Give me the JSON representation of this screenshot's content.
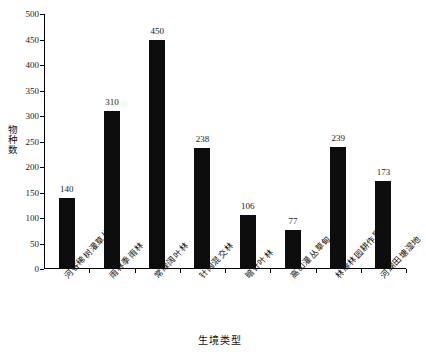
{
  "chart_data": {
    "type": "bar",
    "title": "",
    "xlabel": "生境类型",
    "ylabel": "物种数",
    "categories": [
      "河谷稀树灌草丛",
      "雨林季雨林",
      "常绿阔叶林",
      "针阔混交林",
      "暗针叶林",
      "高山灌丛草甸",
      "林缘林园耕作旱地",
      "河湖田塘湿地"
    ],
    "values": [
      140,
      310,
      450,
      238,
      106,
      77,
      239,
      173
    ],
    "value_labels": [
      "140",
      "310",
      "450",
      "238",
      "106",
      "77",
      "239",
      "173"
    ],
    "ylim": [
      0,
      500
    ],
    "ytick_step": 50,
    "ytick_labels": [
      "0",
      "50",
      "100",
      "150",
      "200",
      "250",
      "300",
      "350",
      "400",
      "450",
      "500"
    ],
    "grid": false,
    "legend": "none",
    "bar_color": "#0d0d0d"
  }
}
